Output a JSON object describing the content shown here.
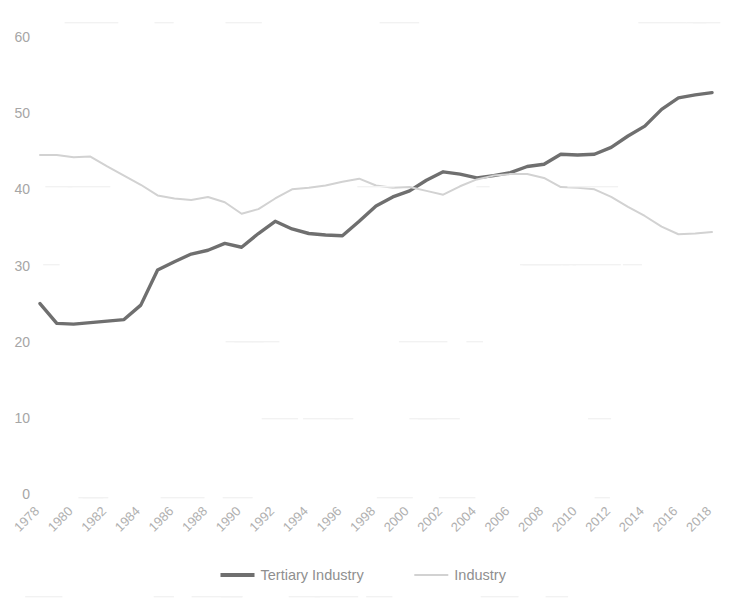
{
  "chart": {
    "title": "",
    "background_color": "#ffffff",
    "axis_label_color": "#a6a6a6",
    "plot": {
      "left": 40,
      "right": 712,
      "top": 37,
      "bottom": 494
    }
  },
  "legend": {
    "position": "bottom",
    "entries": [
      {
        "label": "Tertiary Industry",
        "color": "#6f6f6f",
        "width": 3.4
      },
      {
        "label": "Industry",
        "color": "#d2d2d2",
        "width": 2.0
      }
    ]
  },
  "y_axis": {
    "ticks": [
      "0",
      "10",
      "20",
      "30",
      "40",
      "50",
      "60"
    ],
    "min": 0,
    "max": 60
  },
  "x_axis": {
    "ticks": [
      "1978",
      "1980",
      "1982",
      "1984",
      "1986",
      "1988",
      "1990",
      "1992",
      "1994",
      "1996",
      "1998",
      "2000",
      "2002",
      "2004",
      "2006",
      "2008",
      "2010",
      "2012",
      "2014",
      "2016",
      "2018"
    ],
    "rotation": -45
  },
  "chart_data": {
    "type": "line",
    "title": "",
    "xlabel": "",
    "ylabel": "",
    "ylim": [
      0,
      60
    ],
    "grid": false,
    "legend_position": "bottom",
    "x": [
      1978,
      1979,
      1980,
      1981,
      1982,
      1983,
      1984,
      1985,
      1986,
      1987,
      1988,
      1989,
      1990,
      1991,
      1992,
      1993,
      1994,
      1995,
      1996,
      1997,
      1998,
      1999,
      2000,
      2001,
      2002,
      2003,
      2004,
      2005,
      2006,
      2007,
      2008,
      2009,
      2010,
      2011,
      2012,
      2013,
      2014,
      2015,
      2016,
      2017,
      2018
    ],
    "tick_labels": [
      "1978",
      "1980",
      "1982",
      "1984",
      "1986",
      "1988",
      "1990",
      "1992",
      "1994",
      "1996",
      "1998",
      "2000",
      "2002",
      "2004",
      "2006",
      "2008",
      "2010",
      "2012",
      "2014",
      "2016",
      "2018"
    ],
    "series": [
      {
        "name": "Tertiary Industry",
        "color": "#6f6f6f",
        "stroke_width": 3.4,
        "values": [
          25.0,
          22.4,
          22.3,
          22.5,
          22.7,
          22.9,
          24.8,
          29.4,
          30.5,
          31.5,
          32.0,
          32.9,
          32.4,
          34.2,
          35.8,
          34.8,
          34.2,
          34.0,
          33.9,
          35.8,
          37.8,
          39.0,
          39.8,
          41.2,
          42.3,
          42.0,
          41.5,
          41.8,
          42.2,
          43.0,
          43.3,
          44.6,
          44.5,
          44.6,
          45.5,
          47.0,
          48.3,
          50.5,
          52.0,
          52.4,
          52.7
        ]
      },
      {
        "name": "Industry",
        "color": "#d2d2d2",
        "stroke_width": 2.0,
        "values": [
          44.5,
          44.5,
          44.2,
          44.3,
          43.0,
          41.8,
          40.6,
          39.2,
          38.8,
          38.6,
          39.0,
          38.3,
          36.8,
          37.4,
          38.8,
          40.0,
          40.2,
          40.5,
          41.0,
          41.4,
          40.5,
          40.2,
          40.3,
          39.8,
          39.3,
          40.4,
          41.3,
          41.8,
          42.0,
          42.0,
          41.5,
          40.3,
          40.2,
          40.0,
          39.0,
          37.7,
          36.5,
          35.1,
          34.1,
          34.2,
          34.4
        ]
      }
    ]
  }
}
